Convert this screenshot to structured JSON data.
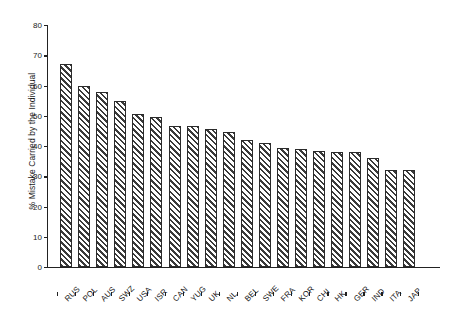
{
  "chart_data": {
    "type": "bar",
    "title": "",
    "xlabel": "",
    "ylabel": "% Mistake Carried by the Individual",
    "ylim": [
      0,
      80
    ],
    "yticks": [
      0,
      10,
      20,
      30,
      40,
      50,
      60,
      70,
      80
    ],
    "grid": false,
    "legend": null,
    "categories": [
      "RUS",
      "POL",
      "AUS",
      "SWZ",
      "USA",
      "ISR",
      "CAN",
      "YUG",
      "UK",
      "NL",
      "BEL",
      "SWE",
      "FRA",
      "KOR",
      "CHI",
      "HK",
      "GER",
      "IND",
      "ITA",
      "JAP"
    ],
    "values": [
      67,
      60,
      58,
      55,
      50.5,
      49.5,
      46.5,
      46.5,
      45.5,
      44.5,
      42,
      41,
      39.5,
      39,
      38.5,
      38,
      38,
      36,
      32,
      32
    ],
    "bar_style": {
      "fill": "#ffffff",
      "hatch": "diagonal-stripes",
      "hatch_color": "#3a3a3a",
      "edge_color": "#2b2b2b"
    },
    "axis_color": "#222222",
    "background": "#ffffff"
  }
}
